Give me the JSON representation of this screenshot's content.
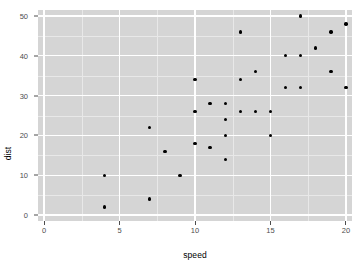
{
  "chart_data": {
    "type": "scatter",
    "title": "",
    "xlabel": "speed",
    "ylabel": "dist",
    "xlim": [
      -0.4,
      20.4
    ],
    "ylim": [
      -1.5,
      51.5
    ],
    "grid": true,
    "legend": null,
    "x_ticks": [
      0,
      5,
      10,
      15,
      20
    ],
    "y_ticks": [
      0,
      10,
      20,
      30,
      40,
      50
    ],
    "x_tick_labels": [
      "0",
      "5",
      "10",
      "15",
      "20"
    ],
    "y_tick_labels": [
      "0",
      "10",
      "20",
      "30",
      "40",
      "50"
    ],
    "x_minor_ticks": [
      2.5,
      7.5,
      12.5,
      17.5
    ],
    "y_minor_ticks": [
      5,
      15,
      25,
      35,
      45
    ],
    "point_color": "#000000",
    "panel_color": "#d5d5d5",
    "grid_color": "#ffffff",
    "minor_grid_color": "#e8e8e8",
    "x": [
      4,
      4,
      7,
      7,
      8,
      9,
      10,
      10,
      10,
      11,
      11,
      12,
      12,
      12,
      12,
      13,
      13,
      13,
      13,
      14,
      14,
      14,
      14,
      15,
      15,
      15,
      16,
      16,
      17,
      17,
      17,
      18,
      18,
      18,
      18,
      19,
      19,
      19,
      20,
      20,
      20,
      20,
      20
    ],
    "y": [
      2,
      10,
      4,
      22,
      16,
      10,
      18,
      26,
      34,
      17,
      28,
      14,
      20,
      24,
      28,
      26,
      34,
      34,
      46,
      26,
      36,
      60,
      80,
      20,
      26,
      54,
      32,
      40,
      32,
      40,
      50,
      42,
      56,
      76,
      84,
      36,
      46,
      68,
      32,
      48,
      52,
      56,
      64
    ]
  },
  "points": [
    {
      "speed": 4,
      "dist": 2
    },
    {
      "speed": 4,
      "dist": 10
    },
    {
      "speed": 7,
      "dist": 4
    },
    {
      "speed": 7,
      "dist": 22
    },
    {
      "speed": 8,
      "dist": 16
    },
    {
      "speed": 9,
      "dist": 10
    },
    {
      "speed": 10,
      "dist": 18
    },
    {
      "speed": 10,
      "dist": 26
    },
    {
      "speed": 10,
      "dist": 34
    },
    {
      "speed": 11,
      "dist": 17
    },
    {
      "speed": 11,
      "dist": 28
    },
    {
      "speed": 12,
      "dist": 14
    },
    {
      "speed": 12,
      "dist": 20
    },
    {
      "speed": 12,
      "dist": 24
    },
    {
      "speed": 12,
      "dist": 28
    },
    {
      "speed": 13,
      "dist": 26
    },
    {
      "speed": 13,
      "dist": 34
    },
    {
      "speed": 13,
      "dist": 46
    },
    {
      "speed": 14,
      "dist": 26
    },
    {
      "speed": 14,
      "dist": 36
    },
    {
      "speed": 15,
      "dist": 20
    },
    {
      "speed": 15,
      "dist": 26
    },
    {
      "speed": 16,
      "dist": 32
    },
    {
      "speed": 16,
      "dist": 40
    },
    {
      "speed": 17,
      "dist": 32
    },
    {
      "speed": 17,
      "dist": 40
    },
    {
      "speed": 17,
      "dist": 50
    },
    {
      "speed": 18,
      "dist": 42
    },
    {
      "speed": 19,
      "dist": 36
    },
    {
      "speed": 19,
      "dist": 46
    },
    {
      "speed": 20,
      "dist": 32
    },
    {
      "speed": 20,
      "dist": 48
    }
  ],
  "axis": {
    "x_title": "speed",
    "y_title": "dist"
  }
}
